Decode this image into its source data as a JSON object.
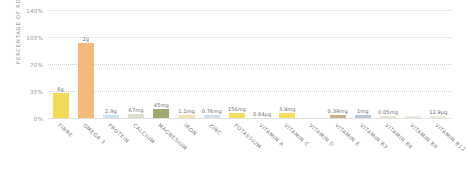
{
  "chart_data": {
    "type": "bar",
    "title": "",
    "xlabel": "",
    "ylabel": "PERCENTAGE OF RDA",
    "ylim": [
      0,
      140
    ],
    "yticks": [
      "0%",
      "35%",
      "70%",
      "105%",
      "140%"
    ],
    "ytick_values": [
      0,
      35,
      70,
      105,
      140
    ],
    "grid": true,
    "legend": "none",
    "categories": [
      "FIBRE",
      "OMEGA 3",
      "PROTEIN",
      "CALCIUM",
      "MAGNESIUM",
      "IRON",
      "ZINC",
      "POTASSIUM",
      "VITAMIN A",
      "VITAMIN C",
      "VITAMIN D",
      "VITAMIN E",
      "VITAMIN B3",
      "VITAMIN B6",
      "VITAMIN B9",
      "VITAMIN B12"
    ],
    "values": [
      33,
      97,
      4,
      5,
      12,
      4,
      4,
      6,
      0,
      6,
      0,
      4,
      4,
      3,
      3,
      3
    ],
    "data_labels": [
      "6g",
      "2g",
      "2.9g",
      "67mg",
      "45mg",
      "1.1mg",
      "0.76mg",
      "156mg",
      "0.64µg",
      "3.9mg",
      "",
      "0.39mg",
      "1mg",
      "0.05mg",
      "",
      "12.9µg"
    ],
    "bar_colors": [
      "#f2da53",
      "#f5b97a",
      "#cfe3ef",
      "#d6e0cc",
      "#9caa72",
      "#f6e3ae",
      "#cfe0ec",
      "#f4e05a",
      "#ffffff",
      "#f4e05a",
      "#ffffff",
      "#cbb08a",
      "#b9c9da",
      "#e9e4d2",
      "#ece8da",
      "#efe9d8"
    ],
    "colors": {
      "grid": "#cfcfcf",
      "axis_text": "#9a9a9a",
      "label_text": "#7d7d7d",
      "value_text": "#6d6d6d",
      "background": "#ffffff"
    }
  }
}
